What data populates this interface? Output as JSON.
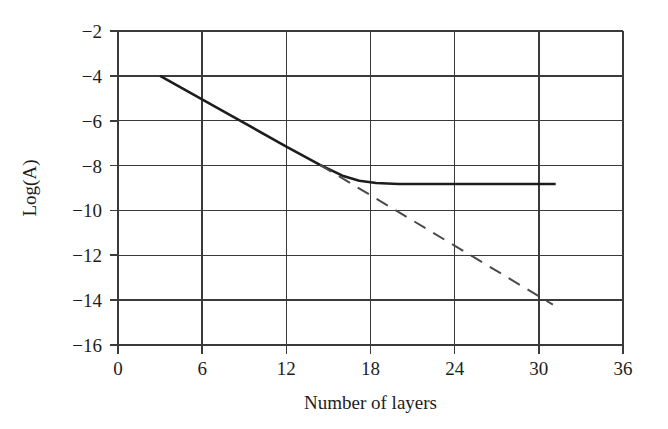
{
  "chart_data": {
    "type": "line",
    "title": "",
    "subtitle": "",
    "xlabel": "Number of layers",
    "ylabel": "Log(A)",
    "xlim": [
      0,
      36
    ],
    "ylim": [
      -16,
      -2
    ],
    "xticks": [
      0,
      6,
      12,
      18,
      24,
      30,
      36
    ],
    "yticks": [
      -16,
      -14,
      -12,
      -10,
      -8,
      -6,
      -4,
      -2
    ],
    "xtick_labels": [
      "0",
      "6",
      "12",
      "18",
      "24",
      "30",
      "36"
    ],
    "ytick_labels": [
      "-16",
      "-14",
      "-12",
      "-10",
      "-8",
      "-6",
      "-4",
      "-2"
    ],
    "grid": true,
    "grid_color": "#3a3a3a",
    "legend": null,
    "annotations": [],
    "series": [
      {
        "name": "measured",
        "style": "solid",
        "color": "#1d1d1d",
        "linewidth": 2.6,
        "points": [
          {
            "x": 3.0,
            "y": -4.0
          },
          {
            "x": 8.0,
            "y": -5.75
          },
          {
            "x": 12.0,
            "y": -7.15
          },
          {
            "x": 14.4,
            "y": -7.97
          },
          {
            "x": 16.0,
            "y": -8.45
          },
          {
            "x": 17.2,
            "y": -8.68
          },
          {
            "x": 18.4,
            "y": -8.78
          },
          {
            "x": 20.0,
            "y": -8.82
          },
          {
            "x": 24.0,
            "y": -8.82
          },
          {
            "x": 31.2,
            "y": -8.82
          }
        ]
      },
      {
        "name": "extrapolated",
        "style": "dashed",
        "color": "#4a4a4a",
        "linewidth": 2.0,
        "dash_pattern": "13 9",
        "points": [
          {
            "x": 14.4,
            "y": -7.97
          },
          {
            "x": 31.0,
            "y": -14.2
          }
        ]
      }
    ]
  },
  "axes": {
    "y_axis_title": "Log(A)",
    "x_axis_title": "Number of layers"
  }
}
